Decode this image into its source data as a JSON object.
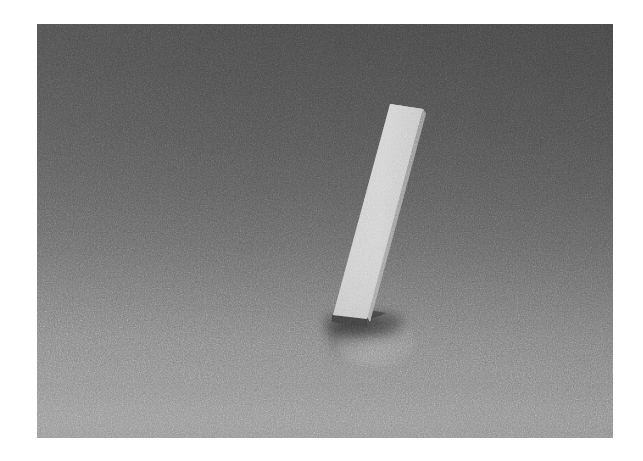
{
  "scene": {
    "title": "Rendered 3D Scene",
    "description": "Tall thin light-gray rectangular slab standing tilted on a gray ground plane",
    "render_style": "noisy / grainy path-traced render",
    "canvas": {
      "width": 643,
      "height": 461,
      "border_color": "#ffffff"
    },
    "image_plate": {
      "x": 37,
      "y": 24,
      "width": 576,
      "height": 414
    }
  },
  "background": {
    "name": "gradient-backdrop",
    "type": "vertical-gradient",
    "top_color": "#434343",
    "mid_color": "#636363",
    "bottom_color": "#8c8c8c",
    "horizon_y": 389
  },
  "objects": [
    {
      "name": "slab",
      "shape": "rectangular-box",
      "front_face_color": "#c9c9c9",
      "top_face_color": "#b4b4b4",
      "side_face_color": "#9a9a9a",
      "base_face_color": "#3c3c3c",
      "tilt": "leaning right toward the top",
      "top_left": [
        354,
        81
      ],
      "top_right": [
        387,
        86
      ],
      "bottom_left": [
        299,
        294
      ],
      "bottom_right": [
        332,
        299
      ]
    }
  ],
  "shadows": [
    {
      "name": "contact-shadow",
      "color": "#000000",
      "opacity": 0.52
    },
    {
      "name": "cast-shadow",
      "color": "#000000",
      "opacity": 0.3
    },
    {
      "name": "floor-highlight",
      "color": "#ffffff",
      "opacity": 0.26
    }
  ],
  "noise": {
    "name": "render-grain",
    "amount": "high",
    "blend": "overlay"
  }
}
